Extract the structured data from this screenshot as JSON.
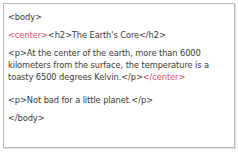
{
  "code_lines": {
    "body_open": "<body>",
    "center_open": "<center>",
    "h2_line": "<h2>The Earth's Core</h2>",
    "p1_line1": "<p>At the center of the earth, more than 6000",
    "p1_line2": "kilometers from the surface, the temperature is a",
    "p1_line3": "toasty 6500 degrees Kelvin.</p>",
    "center_close": "</center>",
    "p2_line": "<p>Not bad for a little planet.</p>",
    "body_close": "</body>"
  },
  "colors": {
    "highlight_tag": "#e0506a",
    "text": "#3a3a3a",
    "border": "#b8b8b8"
  }
}
